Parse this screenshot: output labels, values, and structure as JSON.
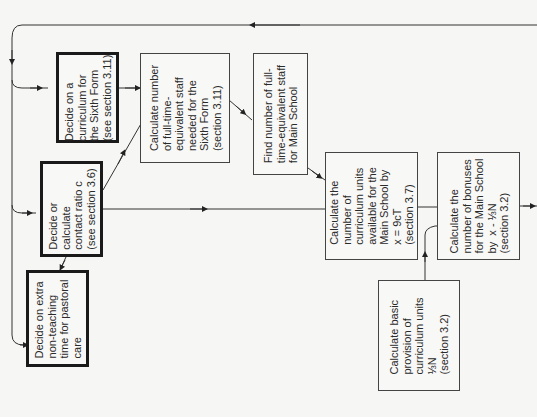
{
  "diagram": {
    "boxes": [
      {
        "id": "sixth-form-curriculum",
        "lines": "Decide on a\ncurriculum for\nthe Sixth Form\n(see section 3.11)",
        "style": "thick"
      },
      {
        "id": "contact-ratio",
        "lines": "Decide or\ncalculate\ncontact ratio c\n(see section 3.6)",
        "style": "thick"
      },
      {
        "id": "pastoral-care",
        "lines": "Decide on extra\nnon-teaching\ntime for pastoral\ncare",
        "style": "thick"
      },
      {
        "id": "sixth-form-staff",
        "lines": "Calculate number\nof full-time-\nequivalent staff\nneeded for the\nSixth Form\n(section 3.11)",
        "style": "thin"
      },
      {
        "id": "main-school-staff",
        "lines": "Find number of full-\ntime-equivalent staff\nfor Main School",
        "style": "thin"
      },
      {
        "id": "curriculum-units",
        "lines": "Calculate the\nnumber of\ncurriculum units\navailable for the\nMain School by\nx = 9cT\n(section 3.7)",
        "style": "thin"
      },
      {
        "id": "bonuses",
        "lines": "Calculate the\nnumber of bonuses\nfor the Main School\nby  x - ⅓N\n(section 3.2)",
        "style": "thin"
      },
      {
        "id": "basic-provision",
        "lines": "Calculate basic\nprovision of\ncurriculum units\n⅓N\n(section 3.2)",
        "style": "thin"
      }
    ]
  }
}
